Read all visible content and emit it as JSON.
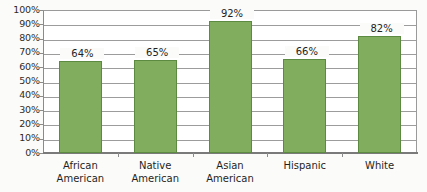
{
  "chart_data": {
    "type": "bar",
    "title": "",
    "subtitle": "",
    "xlabel": "",
    "ylabel": "",
    "categories": [
      "African American",
      "Native American",
      "Asian American",
      "Hispanic",
      "White"
    ],
    "category_lines": [
      [
        "African",
        "American"
      ],
      [
        "Native",
        "American"
      ],
      [
        "Asian",
        "American"
      ],
      [
        "Hispanic"
      ],
      [
        "White"
      ]
    ],
    "values": [
      64,
      65,
      92,
      66,
      82
    ],
    "data_labels": [
      "64%",
      "65%",
      "92%",
      "66%",
      "82%"
    ],
    "ylim": [
      0,
      100
    ],
    "ytick_values": [
      100,
      90,
      80,
      70,
      60,
      50,
      40,
      30,
      20,
      10,
      0
    ],
    "ytick_labels": [
      "100%",
      "90%",
      "80%",
      "70%",
      "60%",
      "50%",
      "40%",
      "30%",
      "20%",
      "10%",
      "0%"
    ],
    "grid": true,
    "legend": false,
    "legend_position": "none",
    "bar_color": "#81ad5f",
    "bar_border_color": "#5d8a41",
    "gridline_color": "#9c9c9c",
    "axis_color": "#8b8b8b",
    "background_color": "#fbfbf9",
    "text_color": "#1f1f1f"
  }
}
